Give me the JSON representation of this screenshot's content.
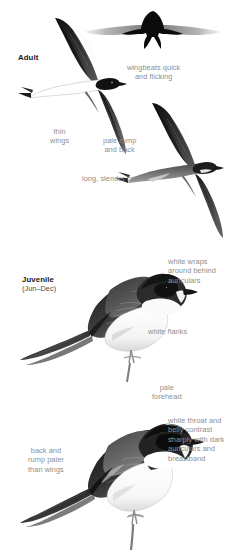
{
  "plate": {
    "subject": "house-martin",
    "background_color": "#ffffff",
    "label_color": "#8e8e8e",
    "age_label_color": "#1a1a1a"
  },
  "panels": [
    {
      "id": "adult-flight",
      "age_label": "Adult",
      "figures": [
        {
          "name": "flight-silhouette-head-on",
          "view": "head-on silhouette"
        },
        {
          "name": "adult-underside-in-flight",
          "view": "underside"
        },
        {
          "name": "adult-upperside-in-flight",
          "view": "upperside"
        }
      ],
      "annotations": [
        {
          "name": "wingbeats",
          "text": "wingbeats quick\nand flicking"
        },
        {
          "name": "thin-wings",
          "text": "thin\nwings"
        },
        {
          "name": "pale-rump",
          "text": "pale rump\nand back"
        },
        {
          "name": "long-tail",
          "text": "long, slender tail"
        }
      ]
    },
    {
      "id": "juvenile",
      "age_label": "Juvenile",
      "age_sublabel": "(Jun–Dec)",
      "figures": [
        {
          "name": "juvenile-perched",
          "view": "perched side"
        }
      ],
      "annotations": [
        {
          "name": "white-wraps",
          "text": "white wraps\naround behind\nauriculars"
        },
        {
          "name": "white-flanks",
          "text": "white flanks"
        }
      ]
    },
    {
      "id": "adult-perched",
      "age_label": "",
      "figures": [
        {
          "name": "adult-perched",
          "view": "perched side"
        }
      ],
      "annotations": [
        {
          "name": "pale-forehead",
          "text": "pale\nforehead"
        },
        {
          "name": "white-throat",
          "text": "white throat and\nbelly contrast\nsharply with dark\nauriculars and\nbreastband"
        },
        {
          "name": "back-rump",
          "text": "back and\nrump paler\nthan wings"
        }
      ]
    }
  ]
}
